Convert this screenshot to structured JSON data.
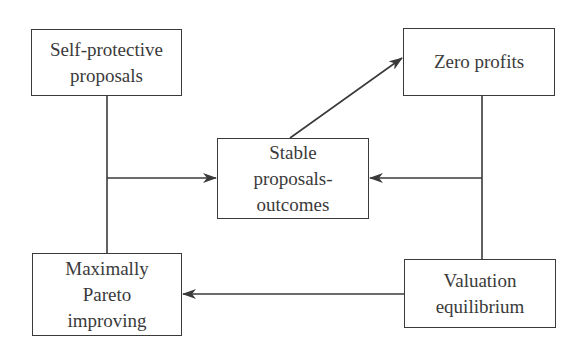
{
  "diagram": {
    "nodes": [
      {
        "id": "self_protective",
        "lines": [
          "Self-protective",
          "proposals"
        ]
      },
      {
        "id": "zero_profits",
        "lines": [
          "Zero profits"
        ]
      },
      {
        "id": "stable",
        "lines": [
          "Stable",
          "proposals-",
          "outcomes"
        ]
      },
      {
        "id": "pareto",
        "lines": [
          "Maximally",
          "Pareto",
          "improving"
        ]
      },
      {
        "id": "valuation",
        "lines": [
          "Valuation",
          "equilibrium"
        ]
      }
    ],
    "edges": [
      {
        "from": "self_protective",
        "to": "stable",
        "type": "arrow"
      },
      {
        "from": "self_protective",
        "to": "pareto",
        "type": "line"
      },
      {
        "from": "stable",
        "to": "zero_profits",
        "type": "arrow"
      },
      {
        "from": "zero_profits",
        "to": "stable",
        "type": "arrow"
      },
      {
        "from": "zero_profits",
        "to": "valuation",
        "type": "line"
      },
      {
        "from": "valuation",
        "to": "pareto",
        "type": "arrow"
      }
    ],
    "colors": {
      "stroke": "#3a3a3a",
      "background": "#ffffff"
    }
  }
}
